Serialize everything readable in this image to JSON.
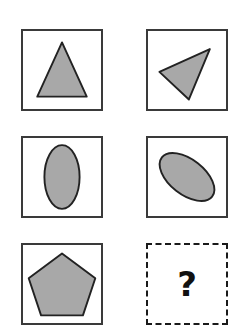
{
  "puzzle": {
    "type": "shape-rotation-analogy-matrix",
    "rows": 3,
    "columns": 2,
    "title": "Shape Rotation Analogy Matrix",
    "colors": {
      "shape_fill": "#a8a8a8",
      "shape_stroke": "#222222",
      "cell_border": "#3a3a3a",
      "placeholder_border": "#1a1a1a",
      "background": "#ffffff",
      "question_mark": "#111111"
    },
    "cells": [
      {
        "id": "cell-r1c1",
        "row": 1,
        "column": 1,
        "shape": "triangle",
        "shape_label": "triangle",
        "orientation": "upright",
        "rotation_degrees": 0,
        "state": "filled",
        "border_style": "solid",
        "box": {
          "x": 21,
          "y": 29,
          "width": 82,
          "height": 82
        },
        "points": "41,69 62,13 88,69"
      },
      {
        "id": "cell-r1c2",
        "row": 1,
        "column": 2,
        "shape": "triangle",
        "shape_label": "rotated triangle",
        "orientation": "rotated",
        "rotation_degrees": 130,
        "state": "filled",
        "border_style": "solid",
        "box": {
          "x": 146,
          "y": 29,
          "width": 82,
          "height": 82
        },
        "points": "64,20 13,42 42,71"
      },
      {
        "id": "cell-r2c1",
        "row": 2,
        "column": 1,
        "shape": "ellipse",
        "shape_label": "ellipse",
        "orientation": "upright",
        "rotation_degrees": 0,
        "state": "filled",
        "border_style": "solid",
        "box": {
          "x": 21,
          "y": 136,
          "width": 82,
          "height": 82
        },
        "ellipse": {
          "cx": 41,
          "cy": 41,
          "rx": 18.5,
          "ry": 33.5,
          "rotate": 0
        }
      },
      {
        "id": "cell-r2c2",
        "row": 2,
        "column": 2,
        "shape": "ellipse",
        "shape_label": "rotated ellipse",
        "orientation": "rotated",
        "rotation_degrees": -45,
        "state": "filled",
        "border_style": "solid",
        "box": {
          "x": 146,
          "y": 136,
          "width": 82,
          "height": 82
        },
        "ellipse": {
          "cx": 41,
          "cy": 41,
          "rx": 18.5,
          "ry": 33.5,
          "rotate": -52
        }
      },
      {
        "id": "cell-r3c1",
        "row": 3,
        "column": 1,
        "shape": "pentagon",
        "shape_label": "pentagon",
        "orientation": "upright",
        "rotation_degrees": 0,
        "state": "filled",
        "border_style": "solid",
        "box": {
          "x": 21,
          "y": 243,
          "width": 82,
          "height": 82
        },
        "points": "41,9 74,33 61,72 21,72 8,33"
      },
      {
        "id": "cell-r3c2",
        "row": 3,
        "column": 2,
        "shape": "none",
        "shape_label": "unknown answer",
        "orientation": "unknown",
        "state": "placeholder",
        "border_style": "dashed",
        "box": {
          "x": 146,
          "y": 243,
          "width": 82,
          "height": 82
        },
        "placeholder_text": "?"
      }
    ]
  }
}
